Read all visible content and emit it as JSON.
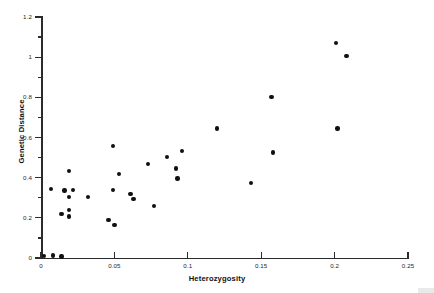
{
  "chart_data": {
    "type": "scatter",
    "title": "",
    "xlabel": "Heterozygosity",
    "ylabel": "Genetic Distance",
    "xlim": [
      0,
      0.25
    ],
    "ylim": [
      0,
      1.2
    ],
    "xticks": [
      0,
      0.05,
      0.1,
      0.15,
      0.2,
      0.25
    ],
    "xtick_labels": [
      "0",
      "0.05",
      "0.1",
      "0.15",
      "0.2",
      "0.25"
    ],
    "yticks": [
      0,
      0.2,
      0.4,
      0.6,
      0.8,
      1,
      1.2
    ],
    "ytick_labels": [
      "0",
      "0.2",
      "0.4",
      "0.6",
      "0.8",
      "1",
      "1.2"
    ],
    "yminor_ticks": [
      0.1,
      0.3,
      0.5,
      0.7,
      0.9,
      1.1
    ],
    "grid": false,
    "legend": false,
    "marker": "filled-circle",
    "marker_color": "#111111",
    "points": [
      {
        "x": 0.002,
        "y": 0.01
      },
      {
        "x": 0.007,
        "y": 0.345
      },
      {
        "x": 0.008,
        "y": 0.013
      },
      {
        "x": 0.014,
        "y": 0.008
      },
      {
        "x": 0.014,
        "y": 0.22
      },
      {
        "x": 0.016,
        "y": 0.336
      },
      {
        "x": 0.019,
        "y": 0.433
      },
      {
        "x": 0.019,
        "y": 0.304
      },
      {
        "x": 0.019,
        "y": 0.24
      },
      {
        "x": 0.019,
        "y": 0.207
      },
      {
        "x": 0.022,
        "y": 0.34
      },
      {
        "x": 0.032,
        "y": 0.304
      },
      {
        "x": 0.046,
        "y": 0.188
      },
      {
        "x": 0.049,
        "y": 0.558
      },
      {
        "x": 0.049,
        "y": 0.34
      },
      {
        "x": 0.05,
        "y": 0.165
      },
      {
        "x": 0.053,
        "y": 0.417
      },
      {
        "x": 0.061,
        "y": 0.32
      },
      {
        "x": 0.063,
        "y": 0.293
      },
      {
        "x": 0.073,
        "y": 0.468
      },
      {
        "x": 0.077,
        "y": 0.258
      },
      {
        "x": 0.086,
        "y": 0.503
      },
      {
        "x": 0.092,
        "y": 0.445
      },
      {
        "x": 0.093,
        "y": 0.396
      },
      {
        "x": 0.096,
        "y": 0.533
      },
      {
        "x": 0.12,
        "y": 0.645
      },
      {
        "x": 0.143,
        "y": 0.375
      },
      {
        "x": 0.157,
        "y": 0.803
      },
      {
        "x": 0.158,
        "y": 0.525
      },
      {
        "x": 0.201,
        "y": 1.07
      },
      {
        "x": 0.202,
        "y": 0.645
      },
      {
        "x": 0.208,
        "y": 1.005
      }
    ]
  }
}
